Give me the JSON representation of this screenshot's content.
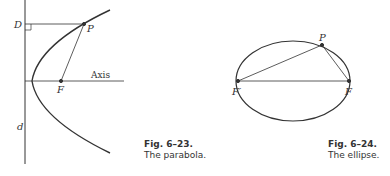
{
  "figures": [
    {
      "id": "fig-6-23",
      "caption_number": "Fig. 6–23.",
      "caption_text": "The parabola.",
      "labels": {
        "directrix_point": "D",
        "point": "P",
        "focus": "F",
        "axis": "Axis",
        "directrix": "d"
      }
    },
    {
      "id": "fig-6-24",
      "caption_number": "Fig. 6–24.",
      "caption_text": "The ellipse.",
      "labels": {
        "point": "P",
        "focus_left": "F′",
        "focus_right": "F"
      }
    }
  ],
  "colors": {
    "ink": "#333333",
    "background": "#ffffff"
  }
}
